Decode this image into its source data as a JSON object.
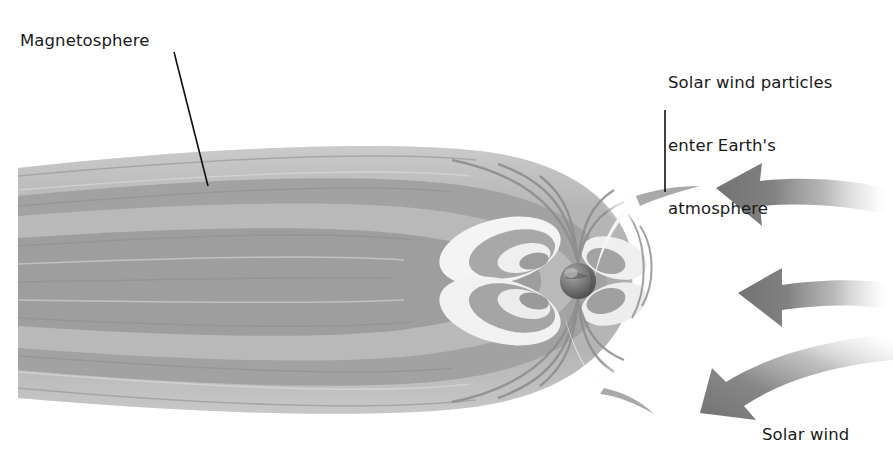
{
  "figure": {
    "kind": "scientific-illustration",
    "background_color": "#ffffff",
    "width": 893,
    "height": 461
  },
  "labels": {
    "magnetosphere": "Magnetosphere",
    "solar_wind_entry_line1": "Solar wind particles",
    "solar_wind_entry_line2": "enter Earth's",
    "solar_wind_entry_line3": "atmosphere",
    "solar_wind": "Solar wind"
  },
  "colors": {
    "text": "#1a1a1a",
    "leader_line": "#111111",
    "field_light": "#c9c9c9",
    "field_mid": "#a8a8a8",
    "field_dark": "#8f8f8f",
    "field_darkest": "#7d7d7d",
    "cusp_highlight": "#f2f2f2",
    "earth_dark": "#4f4f4f",
    "earth_light": "#9a9a9a",
    "arrow": "#7d7d7d"
  },
  "leader_lines": [
    {
      "name": "magnetosphere-leader",
      "x1": 174,
      "y1": 52,
      "x2": 208,
      "y2": 186
    },
    {
      "name": "solar-wind-entry-leader",
      "x1": 665,
      "y1": 110,
      "x2": 665,
      "y2": 192
    }
  ],
  "earth": {
    "cx": 578,
    "cy": 281,
    "r": 18
  },
  "solar_wind_arrows": [
    {
      "name": "solar-wind-arrow-top",
      "tip_x": 716,
      "tip_y": 188,
      "tail_x": 893,
      "tail_y": 196,
      "tilt": "slight-up"
    },
    {
      "name": "solar-wind-arrow-middle",
      "tip_x": 738,
      "tip_y": 293,
      "tail_x": 893,
      "tail_y": 291,
      "tilt": "level"
    },
    {
      "name": "solar-wind-arrow-bottom",
      "tip_x": 700,
      "tip_y": 413,
      "tail_x": 893,
      "tail_y": 360,
      "tilt": "down-left"
    }
  ],
  "cusps": [
    {
      "name": "northern-cusp-entry",
      "x": 640,
      "y": 196
    },
    {
      "name": "southern-cusp-entry",
      "x": 600,
      "y": 392
    }
  ]
}
